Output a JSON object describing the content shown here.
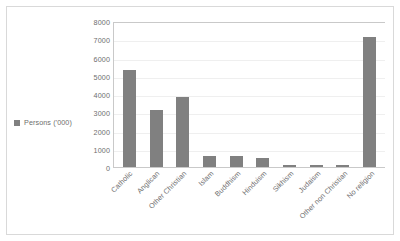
{
  "chart_data": {
    "type": "bar",
    "title": "",
    "subtitle": "",
    "xlabel": "",
    "ylabel": "",
    "categories": [
      "Catholic",
      "Anglican",
      "Other Christian",
      "Islam",
      "Buddhism",
      "Hinduism",
      "Sikhism",
      "Judaism",
      "Other non Christian",
      "No religion"
    ],
    "series": [
      {
        "name": "Persons ('000)",
        "values": [
          5300,
          3150,
          3850,
          600,
          580,
          480,
          130,
          100,
          110,
          7100
        ],
        "color": "#808080"
      }
    ],
    "ylim": [
      0,
      8000
    ],
    "y_ticks": [
      0,
      1000,
      2000,
      3000,
      4000,
      5000,
      6000,
      7000,
      8000
    ],
    "y_tick_labels": [
      "0",
      "1000",
      "2000",
      "3000",
      "4000",
      "5000",
      "6000",
      "7000",
      "8000"
    ],
    "grid": true,
    "grid_axis": "y",
    "legend": {
      "position": "left",
      "entries": [
        {
          "label": "Persons ('000)",
          "swatch_icon": "legend-square-marker",
          "color": "#808080"
        }
      ]
    }
  },
  "colors": {
    "bar": "#808080",
    "gridline": "#efefef",
    "axis": "#c9c9c9",
    "frame": "#d9d9d9",
    "text": "#6e6e6e",
    "background": "#ffffff"
  }
}
